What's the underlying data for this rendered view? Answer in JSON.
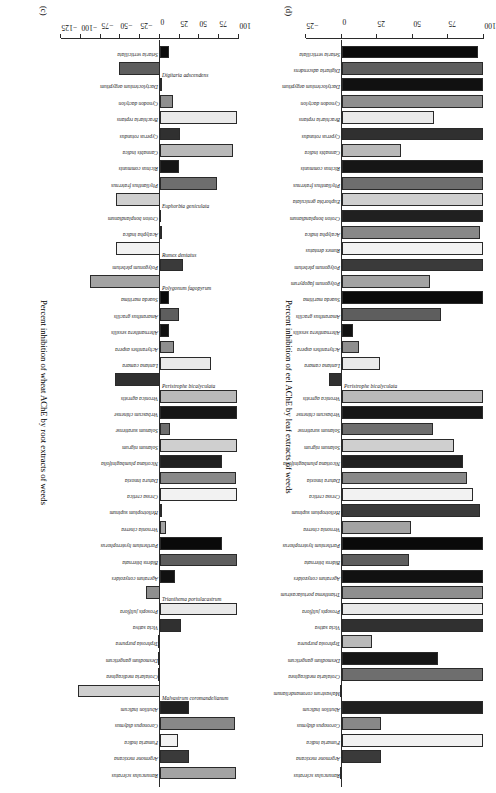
{
  "figure": {
    "panels": [
      "c",
      "d"
    ]
  },
  "chart_data": [
    {
      "id": "c",
      "type": "bar",
      "orientation": "vertical",
      "panel_label": "(c)",
      "title": "",
      "xlabel": "",
      "ylabel": "Percent inhibition of wheat AChE by root extracts of weeds",
      "ylim": [
        -125,
        100
      ],
      "yticks": [
        -125,
        -100,
        -75,
        -50,
        -25,
        0,
        25,
        50,
        75,
        100
      ],
      "ticklabels": [
        "−125",
        "−100",
        "−75",
        "−50",
        "−25",
        "0",
        "25",
        "50",
        "75",
        "100"
      ],
      "grid": false,
      "legend": "none",
      "categories": [
        "Setaria verticillata",
        "Digitaria adscendens",
        "Dactyloctenium aegyptium",
        "Cynodon dactylon",
        "Brachiaria reptans",
        "Cyperus rotundus",
        "Cannabis indica",
        "Ricinus communis",
        "Phyllanthus fraternus",
        "Euphorbia geniculata",
        "Croton bonplandianum",
        "Acalypha indica",
        "Rumex dentatus",
        "Polygonum plebeium",
        "Polygonum fagopyrum",
        "Suaeda maritima",
        "Amaranthus gracilis",
        "Alternanthera sessilis",
        "Achyranthes aspera",
        "Lantana camara",
        "Peristrophe bicalyculata",
        "Veronica agrestis",
        "Verbascum chinense",
        "Solanum surattense",
        "Solanum nigrum",
        "Nicotiana plumbaginifolia",
        "Datura innoxia",
        "Cressa cretica",
        "Heliotropium supinum",
        "Vernonia cinerea",
        "Parthenium hysterophorus",
        "Bidens biternata",
        "Ageratum conyzoides",
        "Trianthema portulacastrum",
        "Prosopis juliflora",
        "Vicia sativa",
        "Tephrosia purpurea",
        "Desmodium gangeticum",
        "Crotalaria medicaginea",
        "Malvastrum coromandelianum",
        "Abutilon indicum",
        "Coronopus didymus",
        "Fumaria indica",
        "Argemone mexicana",
        "Ranunculus scleratus"
      ],
      "values": [
        12,
        -52,
        3,
        17,
        97,
        25,
        92,
        24,
        72,
        -55,
        2,
        3,
        -56,
        29,
        -88,
        12,
        24,
        12,
        18,
        64,
        -57,
        97,
        97,
        13,
        98,
        78,
        96,
        97,
        3,
        8,
        78,
        98,
        19,
        -17,
        97,
        27,
        0,
        0,
        0,
        -104,
        37,
        95,
        23,
        37,
        96
      ]
    },
    {
      "id": "d",
      "type": "bar",
      "orientation": "vertical",
      "panel_label": "(d)",
      "title": "",
      "xlabel": "",
      "ylabel": "Percent inhibition of eel AChE by leaf extracts of weeds",
      "ylim": [
        -25,
        100
      ],
      "yticks": [
        -25,
        0,
        25,
        50,
        75,
        100
      ],
      "ticklabels": [
        "−25",
        "0",
        "25",
        "50",
        "75",
        "100"
      ],
      "grid": false,
      "legend": "none",
      "categories": [
        "Setaria verticillata",
        "Digitaria adscendens",
        "Dactyloctenium aegyptium",
        "Cynodon dactylon",
        "Brachiaria reptans",
        "Cyperus rotundus",
        "Cannabis indica",
        "Ricinus communis",
        "Phyllanthus fraternus",
        "Euphorbia geniculata",
        "Croton bonplandianum",
        "Acalypha indica",
        "Rumex dentatus",
        "Polygonum plebeium",
        "Polygonum fagopyrum",
        "Suaeda maritima",
        "Amaranthus gracilis",
        "Alternanthera sessilis",
        "Achyranthes aspera",
        "Lantana camara",
        "Peristrophe bicalyculata",
        "Veronica agrestis",
        "Verbascum chinense",
        "Solanum surattense",
        "Solanum nigrum",
        "Nicotiana plumbaginifolia",
        "Datura innoxia",
        "Cressa cretica",
        "Heliotropium supinum",
        "Vernonia cinerea",
        "Parthenium hysterophorus",
        "Bidens biternata",
        "Ageratum conyzoides",
        "Trianthema portulacastrum",
        "Prosopis juliflora",
        "Vicia sativa",
        "Tephrosia purpurea",
        "Desmodium gangeticum",
        "Crotalaria medicaginea",
        "Malvastrum coromandelianum",
        "Abutilon indicum",
        "Coronopus didymus",
        "Fumaria indica",
        "Argemone mexicana",
        "Ranunculus scleratus"
      ],
      "values": [
        96,
        99,
        99,
        99,
        65,
        99,
        42,
        99,
        99,
        99,
        99,
        97,
        99,
        99,
        62,
        99,
        70,
        8,
        12,
        27,
        -9,
        99,
        99,
        64,
        79,
        85,
        88,
        92,
        97,
        49,
        99,
        47,
        99,
        99,
        99,
        99,
        21,
        68,
        99,
        0,
        99,
        28,
        99,
        28,
        0
      ]
    }
  ],
  "panel_c": {
    "tag": "(c)",
    "axis_title": "Percent inhibition of wheat AChE by root extracts of weeds"
  },
  "panel_d": {
    "tag": "(d)",
    "axis_title": "Percent inhibition of eel AChE by leaf extracts of weeds"
  }
}
